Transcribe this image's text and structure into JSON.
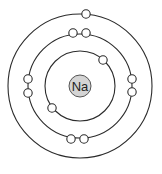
{
  "diagram": {
    "nucleus": {
      "symbol": "Na",
      "fill": "#d4d4d4",
      "cx": 80,
      "cy": 86,
      "r": 11
    },
    "orbits": [
      {
        "name": "shell-1",
        "r": 35,
        "electrons": 2
      },
      {
        "name": "shell-2",
        "r": 52,
        "electrons": 8
      },
      {
        "name": "shell-3",
        "r": 72,
        "electrons": 1
      }
    ],
    "electron_count": 11,
    "line_color": "#2b2b2b"
  }
}
